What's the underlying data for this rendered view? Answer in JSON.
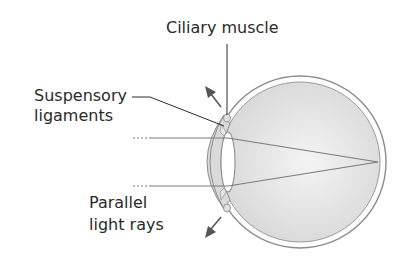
{
  "diagram": {
    "type": "anatomy-eye-distant-focus",
    "labels": {
      "ciliary_muscle": "Ciliary muscle",
      "suspensory_line1": "Suspensory",
      "suspensory_line2": "ligaments",
      "parallel_line1": "Parallel",
      "parallel_line2": "light rays"
    },
    "colors": {
      "outline": "#8c8c8c",
      "fill": "#dcdcdc",
      "ray": "#7a7a7a",
      "text": "#2a2a2a",
      "arrow": "#555555"
    }
  }
}
